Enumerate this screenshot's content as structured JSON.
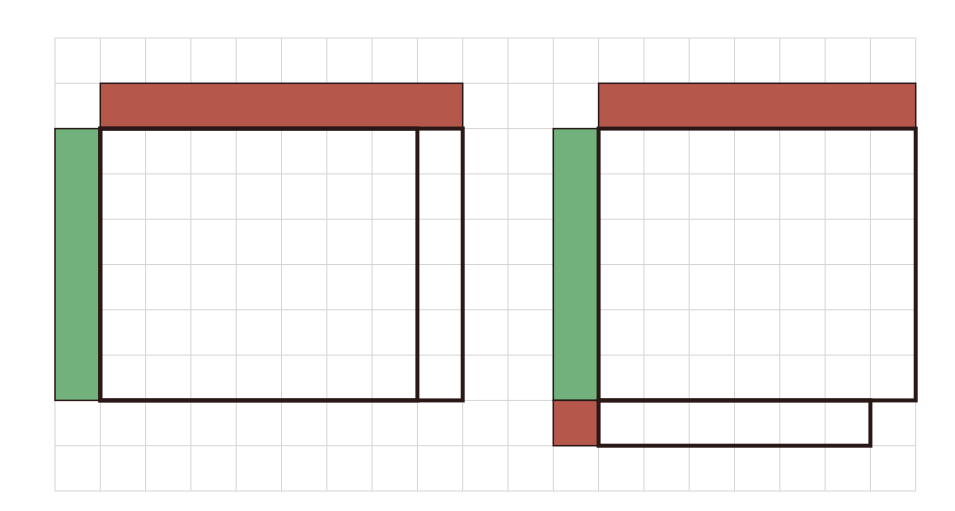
{
  "grid": {
    "origin_x": 55,
    "origin_y": 38,
    "cell": 45.3,
    "cols": 19,
    "rows": 10,
    "line_color": "#d4d4d4"
  },
  "colors": {
    "red": "#b5574b",
    "green": "#72b07c",
    "outline": "#2a1816"
  },
  "diagrams": [
    {
      "name": "left-diagram",
      "red_bar": {
        "col": 1,
        "row": 1,
        "w": 8,
        "h": 1
      },
      "green_bar": {
        "col": 0,
        "row": 2,
        "w": 1,
        "h": 6
      },
      "outlines": [
        {
          "col": 1,
          "row": 2,
          "w": 8,
          "h": 6
        },
        {
          "col": 1,
          "row": 2,
          "w": 7,
          "h": 6
        }
      ],
      "extra_red": []
    },
    {
      "name": "right-diagram",
      "red_bar": {
        "col": 12,
        "row": 1,
        "w": 7,
        "h": 1
      },
      "green_bar": {
        "col": 11,
        "row": 2,
        "w": 1,
        "h": 6
      },
      "outlines": [
        {
          "col": 12,
          "row": 2,
          "w": 7,
          "h": 6
        },
        {
          "col": 12,
          "row": 8,
          "w": 6,
          "h": 1
        }
      ],
      "extra_red": [
        {
          "col": 11,
          "row": 8,
          "w": 1,
          "h": 1
        }
      ]
    }
  ]
}
